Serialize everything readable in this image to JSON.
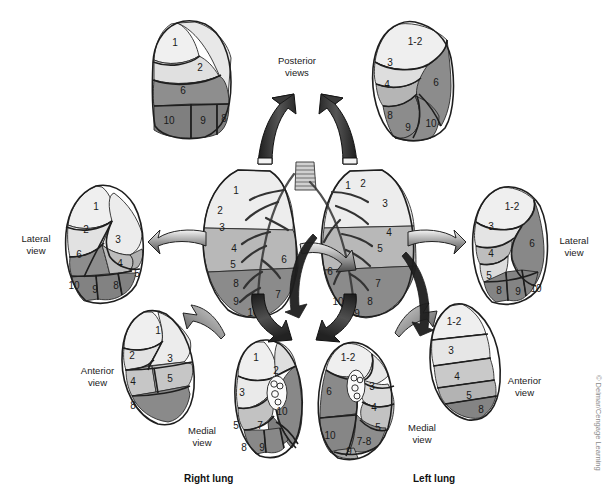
{
  "figure": {
    "title_right": "Right lung",
    "title_left": "Left lung",
    "copyright": "© Delmar/Cengage Learning"
  },
  "palette": {
    "very_light": "#eeeeee",
    "light": "#dedede",
    "mid_light": "#c9c9c9",
    "mid": "#b3b3b3",
    "mid_dark": "#9a9a9a",
    "dark": "#8a8a8a",
    "darker": "#7d7d7d",
    "outline": "#1e1e1e",
    "text": "#1a1a1a",
    "arrow_dark": "#2e2e2e",
    "arrow_mid": "#8f8f8f",
    "background": "#ffffff"
  },
  "labels": {
    "posterior_views": "Posterior\nviews",
    "lateral_view": "Lateral\nview",
    "anterior_view": "Anterior\nview",
    "medial_view": "Medial\nview"
  },
  "views": {
    "right_posterior": {
      "name": "Right lung posterior view",
      "segments": [
        "1",
        "2",
        "6",
        "10",
        "9",
        "8"
      ]
    },
    "left_posterior": {
      "name": "Left lung posterior view",
      "segments": [
        "1-2",
        "3",
        "4",
        "6",
        "8",
        "9",
        "10"
      ]
    },
    "right_lateral": {
      "name": "Right lung lateral view",
      "segments": [
        "1",
        "2",
        "3",
        "6",
        "4",
        "5",
        "10",
        "9",
        "8"
      ]
    },
    "left_lateral": {
      "name": "Left lung lateral view",
      "segments": [
        "1-2",
        "3",
        "4",
        "5",
        "6",
        "8",
        "9",
        "10"
      ]
    },
    "right_anterior": {
      "name": "Right lung anterior view",
      "segments": [
        "1",
        "2",
        "3",
        "4",
        "5",
        "8"
      ]
    },
    "left_anterior": {
      "name": "Left lung anterior view",
      "segments": [
        "1-2",
        "3",
        "4",
        "5",
        "8"
      ]
    },
    "right_medial": {
      "name": "Right lung medial view",
      "segments": [
        "1",
        "2",
        "3",
        "5",
        "7",
        "8",
        "9",
        "10"
      ]
    },
    "left_medial": {
      "name": "Left lung medial view",
      "segments": [
        "1-2",
        "3",
        "4",
        "5",
        "6",
        "7-8",
        "9",
        "10"
      ]
    },
    "center_right": {
      "name": "Right lung with bronchial tree",
      "segments": [
        "1",
        "2",
        "3",
        "4",
        "5",
        "6",
        "8",
        "9",
        "10",
        "7"
      ]
    },
    "center_left": {
      "name": "Left lung with bronchial tree",
      "segments": [
        "1",
        "2",
        "3",
        "4",
        "5",
        "6",
        "7",
        "8",
        "9",
        "10"
      ]
    }
  }
}
